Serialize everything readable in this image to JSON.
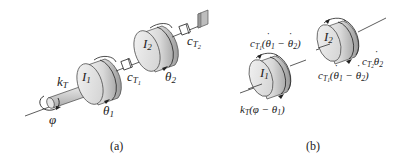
{
  "figure": {
    "panel_a": {
      "caption": "(a)",
      "labels": {
        "I1": "I",
        "I1_sub": "1",
        "I2": "I",
        "I2_sub": "2",
        "kT": "k",
        "kT_sub": "T",
        "cT1": "c",
        "cT1_sub": "T",
        "cT1_subsub": "1",
        "cT2": "c",
        "cT2_sub": "T",
        "cT2_subsub": "2",
        "theta1": "θ",
        "theta1_sub": "1",
        "theta2": "θ",
        "theta2_sub": "2",
        "phi": "φ"
      }
    },
    "panel_b": {
      "caption": "(b)",
      "labels": {
        "I1": "I",
        "I1_sub": "1",
        "I2": "I",
        "I2_sub": "2",
        "torque_damper_top": "c",
        "torque_damper_top_sub": "T",
        "torque_damper_top_subsub": "1",
        "torque_damper_top_expr_open": "(",
        "theta": "θ",
        "one": "1",
        "two": "2",
        "minus": " − ",
        "close": ")",
        "torque_spring": "k",
        "torque_spring_sub": "T",
        "torque_spring_expr": "(φ − θ",
        "torque_spring_close": ")",
        "torque_damper2": "c",
        "torque_damper2_sub": "T",
        "torque_damper2_subsub": "2"
      }
    }
  },
  "colors": {
    "disk_fill_light": "#f0f0f0",
    "disk_fill_dark": "#b8b8b8",
    "line": "#333333",
    "wall": "#bdbdbd"
  }
}
